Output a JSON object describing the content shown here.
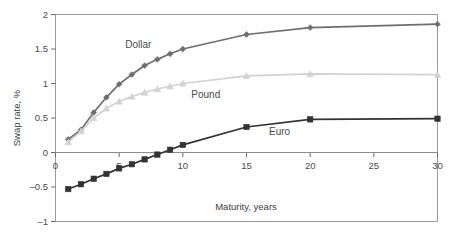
{
  "chart_data": {
    "type": "line",
    "title": "",
    "xlabel": "Maturity, years",
    "ylabel": "Swap rate, %",
    "xlim": [
      0,
      30
    ],
    "ylim": [
      -1,
      2
    ],
    "xticks": [
      "0",
      "5",
      "10",
      "15",
      "20",
      "25",
      "30"
    ],
    "xtick_values": [
      0,
      5,
      10,
      15,
      20,
      25,
      30
    ],
    "yticks": [
      "2",
      "1.5",
      "1",
      "0.5",
      "0",
      "–0.5",
      "–1"
    ],
    "ytick_values": [
      2,
      1.5,
      1,
      0.5,
      0,
      -0.5,
      -1
    ],
    "grid": false,
    "legend": "inline-labels",
    "x": [
      1,
      2,
      3,
      4,
      5,
      6,
      7,
      8,
      9,
      10,
      15,
      20,
      30
    ],
    "series": [
      {
        "name": "Dollar",
        "color": "#6e6e6e",
        "marker": "diamond",
        "label_x": 6.5,
        "label_y": 1.52,
        "values": [
          0.19,
          0.33,
          0.58,
          0.8,
          0.99,
          1.13,
          1.26,
          1.35,
          1.43,
          1.5,
          1.71,
          1.81,
          1.86
        ]
      },
      {
        "name": "Pound",
        "color": "#d2d2d2",
        "marker": "triangle",
        "label_x": 11.8,
        "label_y": 0.79,
        "values": [
          0.15,
          0.31,
          0.5,
          0.64,
          0.74,
          0.81,
          0.87,
          0.92,
          0.96,
          1.0,
          1.11,
          1.14,
          1.13
        ]
      },
      {
        "name": "Euro",
        "color": "#333333",
        "marker": "square",
        "label_x": 17.6,
        "label_y": 0.26,
        "values": [
          -0.53,
          -0.46,
          -0.38,
          -0.31,
          -0.23,
          -0.17,
          -0.1,
          -0.03,
          0.04,
          0.11,
          0.37,
          0.48,
          0.49
        ]
      }
    ]
  },
  "figure": {
    "background": "#ffffff",
    "frame_color": "#9a9a9a",
    "axis_color": "#6a6a6a"
  }
}
